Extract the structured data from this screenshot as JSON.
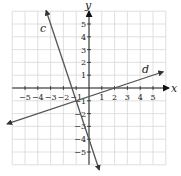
{
  "graph": {
    "x_label": "x",
    "y_label": "y",
    "x_ticks": [
      "−5",
      "−4",
      "−3",
      "−2",
      "−1",
      "1",
      "2",
      "3",
      "4",
      "5"
    ],
    "x_tick_values": [
      -5,
      -4,
      -3,
      -2,
      -1,
      1,
      2,
      3,
      4,
      5
    ],
    "y_ticks": [
      "5",
      "4",
      "3",
      "2",
      "1",
      "−1",
      "−2",
      "−3",
      "−4",
      "−5"
    ],
    "y_tick_values": [
      5,
      4,
      3,
      2,
      1,
      -1,
      -2,
      -3,
      -4,
      -5
    ],
    "range": [
      -6,
      6
    ],
    "lines": [
      {
        "name": "c",
        "label": "c",
        "from": [
          -3.35,
          6.05
        ],
        "to": [
          0.8,
          -6.4
        ],
        "color": "#555555"
      },
      {
        "name": "d",
        "label": "d",
        "from": [
          -6.4,
          -2.8
        ],
        "to": [
          5.8,
          1.27
        ],
        "color": "#555555"
      }
    ],
    "grid_color": "#d8d8d8",
    "axis_color": "#222222"
  }
}
